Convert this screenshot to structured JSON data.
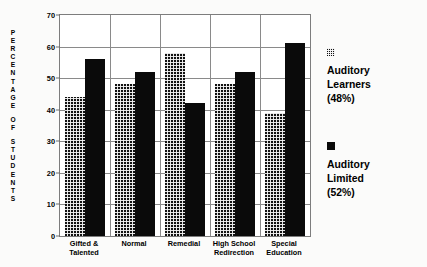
{
  "chart_data": {
    "type": "bar",
    "title": "",
    "xlabel": "",
    "ylabel": "PERCENTAGE OF STUDENTS",
    "ylim": [
      0,
      70
    ],
    "yticks": [
      0,
      10,
      20,
      30,
      40,
      50,
      60,
      70
    ],
    "grid": true,
    "legend_position": "right",
    "categories": [
      "Gifted &\nTalented",
      "Normal",
      "Remedial",
      "High School\nRedirection",
      "Special\nEducation"
    ],
    "series": [
      {
        "name": "Auditory Learners (48%)",
        "swatch": "hatch",
        "values": [
          44,
          48,
          58,
          48,
          39
        ]
      },
      {
        "name": "Auditory Limited (52%)",
        "swatch": "solid",
        "values": [
          56,
          52,
          42,
          52,
          61
        ]
      }
    ]
  },
  "legend": {
    "entries": [
      {
        "swatch": "hatch",
        "line1": "Auditory",
        "line2": "Learners",
        "line3": "(48%)"
      },
      {
        "swatch": "solid",
        "line1": "Auditory",
        "line2": "Limited",
        "line3": "(52%)"
      }
    ]
  },
  "yaxis_title_letters": [
    "P",
    "E",
    "R",
    "C",
    "E",
    "N",
    "T",
    "A",
    "G",
    "E",
    " ",
    "O",
    "F",
    " ",
    "S",
    "T",
    "U",
    "D",
    "E",
    "N",
    "T",
    "S"
  ]
}
